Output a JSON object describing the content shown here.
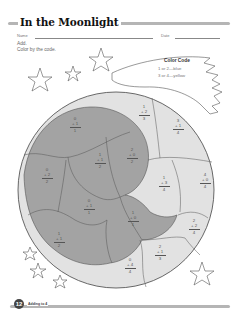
{
  "header": {
    "title": "In the Moonlight",
    "name_label": "Name",
    "date_label": "Date"
  },
  "instructions": {
    "line1": "Add.",
    "line2": "Color by the code."
  },
  "color_code": {
    "title": "Color Code",
    "rules": [
      {
        "text": "1 or 2—blue",
        "color": "blue"
      },
      {
        "text": "3 or 4—yellow",
        "color": "yellow"
      }
    ]
  },
  "colors": {
    "dark_region": "#a3a3a3",
    "light_region": "#e2e2e2",
    "outline": "#555555",
    "title_stroke": "#b5b5b5"
  },
  "problems": [
    {
      "id": "p1",
      "top": "0",
      "add": "+ 1",
      "sum": "1",
      "shade": "dark"
    },
    {
      "id": "p2",
      "top": "1",
      "add": "+ 2",
      "sum": "3",
      "shade": "light"
    },
    {
      "id": "p3",
      "top": "3",
      "add": "+ 1",
      "sum": "4",
      "shade": "light"
    },
    {
      "id": "p4",
      "top": "1",
      "add": "+ 1",
      "sum": "2",
      "shade": "dark"
    },
    {
      "id": "p5",
      "top": "2",
      "add": "+ 0",
      "sum": "2",
      "shade": "dark"
    },
    {
      "id": "p6",
      "top": "0",
      "add": "+ 2",
      "sum": "2",
      "shade": "dark"
    },
    {
      "id": "p7",
      "top": "1",
      "add": "+ 3",
      "sum": "4",
      "shade": "light"
    },
    {
      "id": "p8",
      "top": "4",
      "add": "+ 0",
      "sum": "4",
      "shade": "light"
    },
    {
      "id": "p9",
      "top": "0",
      "add": "+ 1",
      "sum": "1",
      "shade": "dark"
    },
    {
      "id": "p10",
      "top": "1",
      "add": "+ 0",
      "sum": "1",
      "shade": "dark"
    },
    {
      "id": "p11",
      "top": "2",
      "add": "+ 2",
      "sum": "4",
      "shade": "light"
    },
    {
      "id": "p12",
      "top": "1",
      "add": "+ 1",
      "sum": "2",
      "shade": "dark"
    },
    {
      "id": "p13",
      "top": "2",
      "add": "+ 1",
      "sum": "3",
      "shade": "light"
    },
    {
      "id": "p14",
      "top": "0",
      "add": "+ 4",
      "sum": "4",
      "shade": "light"
    }
  ],
  "footer": {
    "page_number": "12",
    "label": "Adding to 4"
  }
}
